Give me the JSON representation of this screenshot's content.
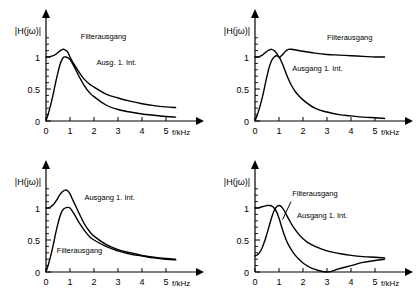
{
  "figure": {
    "axis": {
      "ylabel": "|H(jω)|",
      "xlabel": "f/kHz",
      "yticks": [
        "0",
        "0.5",
        "1"
      ],
      "ytick_values": [
        0,
        0.5,
        1
      ],
      "xticks": [
        "0",
        "1",
        "2",
        "3",
        "4",
        "5"
      ],
      "xtick_values": [
        0,
        1,
        2,
        3,
        4,
        5
      ],
      "xlim": [
        0,
        5.6
      ],
      "ylim": [
        0,
        1.45
      ],
      "minor_y_count": 10,
      "grid": false
    },
    "colors": {
      "curve": "#000000",
      "axis": "#000000",
      "background": "#ffffff"
    },
    "panels": [
      {
        "id": "top-left",
        "position": "top-left",
        "labels": [
          {
            "name": "filterausgang",
            "text": "Filterausgang",
            "x": 1.45,
            "y": 1.28
          },
          {
            "name": "ausgang-1-int",
            "text": "Ausg. 1. Int.",
            "x": 2.1,
            "y": 0.88
          }
        ]
      },
      {
        "id": "top-right",
        "position": "top-right",
        "labels": [
          {
            "name": "filterausgang",
            "text": "Filterausgang",
            "x": 3.0,
            "y": 1.27
          },
          {
            "name": "ausgang-1-int",
            "text": "Ausgang 1. Int.",
            "x": 1.55,
            "y": 0.78
          }
        ]
      },
      {
        "id": "bottom-left",
        "position": "bottom-left",
        "labels": [
          {
            "name": "ausgang-1-int",
            "text": "Ausgang 1. Int.",
            "x": 1.6,
            "y": 1.12
          },
          {
            "name": "filterausgang",
            "text": "Filterausgang",
            "x": 0.45,
            "y": 0.3
          }
        ]
      },
      {
        "id": "bottom-right",
        "position": "bottom-right",
        "labels": [
          {
            "name": "filterausgang",
            "text": "Filterausgang",
            "x": 1.55,
            "y": 1.18
          },
          {
            "name": "ausgang-1-int",
            "text": "Ausgang 1. Int.",
            "x": 1.75,
            "y": 0.85
          }
        ],
        "leader": {
          "x1": 1.5,
          "y1": 1.1,
          "x2": 1.15,
          "y2": 0.82
        }
      }
    ]
  },
  "chart_data": [
    {
      "type": "line",
      "id": "top-left",
      "title": "Tiefpass: Filterausgang und Ausgang 1. Integrator",
      "xlabel": "f/kHz",
      "ylabel": "|H(jω)|",
      "xlim": [
        0,
        5.6
      ],
      "ylim": [
        0,
        1.45
      ],
      "grid": false,
      "x": [
        0,
        0.1,
        0.2,
        0.3,
        0.4,
        0.5,
        0.6,
        0.7,
        0.75,
        0.8,
        0.9,
        1.0,
        1.1,
        1.2,
        1.4,
        1.6,
        1.8,
        2.0,
        2.5,
        3.0,
        3.5,
        4.0,
        4.5,
        5.0,
        5.4
      ],
      "series": [
        {
          "name": "Filterausgang",
          "values": [
            1.0,
            1.0,
            1.01,
            1.02,
            1.04,
            1.07,
            1.1,
            1.12,
            1.12,
            1.11,
            1.08,
            1.0,
            0.93,
            0.87,
            0.75,
            0.65,
            0.58,
            0.53,
            0.42,
            0.36,
            0.31,
            0.27,
            0.24,
            0.22,
            0.21
          ]
        },
        {
          "name": "Ausg. 1. Int.",
          "values": [
            0.0,
            0.12,
            0.26,
            0.42,
            0.6,
            0.76,
            0.9,
            0.98,
            1.0,
            1.0,
            0.99,
            0.96,
            0.9,
            0.83,
            0.68,
            0.55,
            0.45,
            0.38,
            0.25,
            0.18,
            0.14,
            0.11,
            0.09,
            0.07,
            0.06
          ]
        }
      ]
    },
    {
      "type": "line",
      "id": "top-right",
      "title": "Hochpass: Filterausgang und Ausgang 1. Integrator",
      "xlabel": "f/kHz",
      "ylabel": "|H(jω)|",
      "xlim": [
        0,
        5.6
      ],
      "ylim": [
        0,
        1.45
      ],
      "grid": false,
      "x": [
        0,
        0.1,
        0.2,
        0.3,
        0.4,
        0.5,
        0.6,
        0.7,
        0.8,
        0.9,
        1.0,
        1.1,
        1.2,
        1.3,
        1.4,
        1.5,
        1.7,
        2.0,
        2.5,
        3.0,
        3.5,
        4.0,
        4.5,
        5.0,
        5.4
      ],
      "series": [
        {
          "name": "Filterausgang",
          "values": [
            1.0,
            1.0,
            1.01,
            1.03,
            1.06,
            1.09,
            1.11,
            1.12,
            1.1,
            1.06,
            1.0,
            1.02,
            1.06,
            1.1,
            1.12,
            1.12,
            1.11,
            1.09,
            1.06,
            1.04,
            1.03,
            1.02,
            1.01,
            1.0,
            1.0
          ]
        },
        {
          "name": "Ausgang 1. Int.",
          "values": [
            0.0,
            0.1,
            0.22,
            0.36,
            0.53,
            0.7,
            0.85,
            0.95,
            1.0,
            1.02,
            1.0,
            0.93,
            0.84,
            0.74,
            0.65,
            0.57,
            0.45,
            0.33,
            0.2,
            0.14,
            0.1,
            0.08,
            0.06,
            0.05,
            0.04
          ]
        }
      ]
    },
    {
      "type": "line",
      "id": "bottom-left",
      "title": "Bandpass: Ausgang 1. Integrator und Filterausgang",
      "xlabel": "f/kHz",
      "ylabel": "|H(jω)|",
      "xlim": [
        0,
        5.6
      ],
      "ylim": [
        0,
        1.45
      ],
      "grid": false,
      "x": [
        0,
        0.1,
        0.2,
        0.3,
        0.4,
        0.5,
        0.6,
        0.7,
        0.8,
        0.9,
        1.0,
        1.1,
        1.2,
        1.4,
        1.6,
        1.8,
        2.0,
        2.5,
        3.0,
        3.5,
        4.0,
        4.5,
        5.0,
        5.4
      ],
      "series": [
        {
          "name": "Ausgang 1. Int.",
          "values": [
            1.0,
            1.0,
            1.02,
            1.05,
            1.1,
            1.16,
            1.22,
            1.26,
            1.28,
            1.27,
            1.22,
            1.14,
            1.06,
            0.9,
            0.75,
            0.64,
            0.56,
            0.43,
            0.35,
            0.3,
            0.26,
            0.23,
            0.21,
            0.2
          ]
        },
        {
          "name": "Filterausgang",
          "values": [
            0.0,
            0.12,
            0.26,
            0.42,
            0.6,
            0.76,
            0.89,
            0.97,
            1.0,
            1.01,
            1.0,
            0.95,
            0.89,
            0.76,
            0.65,
            0.56,
            0.5,
            0.4,
            0.33,
            0.28,
            0.25,
            0.22,
            0.2,
            0.19
          ]
        }
      ]
    },
    {
      "type": "line",
      "id": "bottom-right",
      "title": "Bandsperre: Filterausgang und Ausgang 1. Integrator",
      "xlabel": "f/kHz",
      "ylabel": "|H(jω)|",
      "xlim": [
        0,
        5.6
      ],
      "ylim": [
        0,
        1.45
      ],
      "grid": false,
      "x": [
        0,
        0.1,
        0.2,
        0.3,
        0.4,
        0.5,
        0.6,
        0.7,
        0.8,
        0.9,
        1.0,
        1.1,
        1.2,
        1.3,
        1.4,
        1.6,
        1.8,
        2.0,
        2.2,
        2.5,
        3.0,
        3.5,
        4.0,
        4.5,
        5.0,
        5.4
      ],
      "series": [
        {
          "name": "Filterausgang",
          "values": [
            1.0,
            1.0,
            1.01,
            1.02,
            1.03,
            1.04,
            1.04,
            1.03,
            1.0,
            0.94,
            0.84,
            0.72,
            0.6,
            0.5,
            0.42,
            0.3,
            0.21,
            0.14,
            0.09,
            0.04,
            0.0,
            0.05,
            0.1,
            0.15,
            0.18,
            0.2
          ]
        },
        {
          "name": "Ausgang 1. Int.",
          "values": [
            0.25,
            0.27,
            0.31,
            0.38,
            0.48,
            0.6,
            0.73,
            0.86,
            0.96,
            1.02,
            1.04,
            1.02,
            0.97,
            0.9,
            0.83,
            0.7,
            0.6,
            0.52,
            0.46,
            0.4,
            0.33,
            0.29,
            0.26,
            0.24,
            0.23,
            0.22
          ]
        }
      ]
    }
  ]
}
